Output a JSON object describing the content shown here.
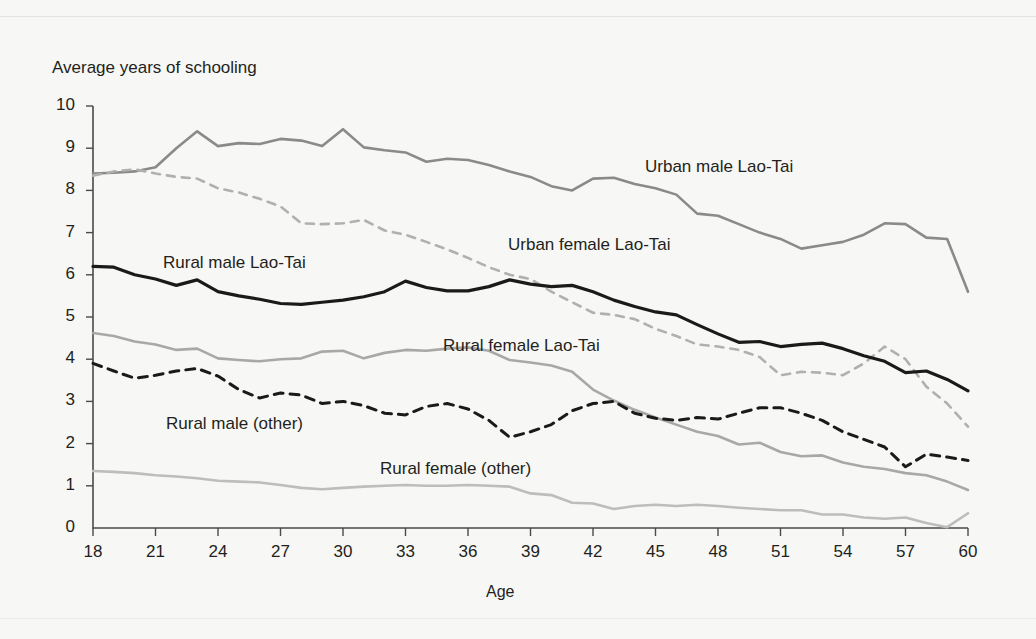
{
  "figure": {
    "y_axis_title": "Average years of schooling",
    "x_axis_title": "Age",
    "top_cropped_caption": "",
    "background_color": "#f7f7f5",
    "text_color": "#231f20"
  },
  "chart_data": {
    "type": "line",
    "title": "Average years of schooling",
    "xlabel": "Age",
    "ylabel": "Average years of schooling",
    "xlim": [
      18,
      60
    ],
    "ylim": [
      0,
      10
    ],
    "grid": false,
    "legend_position": "inline-labels",
    "x_ticks": [
      18,
      21,
      24,
      27,
      30,
      33,
      36,
      39,
      42,
      45,
      48,
      51,
      54,
      57,
      60
    ],
    "y_ticks": [
      0,
      1,
      2,
      3,
      4,
      5,
      6,
      7,
      8,
      9,
      10
    ],
    "x": [
      18,
      19,
      20,
      21,
      22,
      23,
      24,
      25,
      26,
      27,
      28,
      29,
      30,
      31,
      32,
      33,
      34,
      35,
      36,
      37,
      38,
      39,
      40,
      41,
      42,
      43,
      44,
      45,
      46,
      47,
      48,
      49,
      50,
      51,
      52,
      53,
      54,
      55,
      56,
      57,
      58,
      59,
      60
    ],
    "series": [
      {
        "name": "Urban male Lao-Tai",
        "color": "#8a8a8a",
        "style": "solid",
        "width": 2.6,
        "label_position": {
          "x": 645,
          "y": 157
        },
        "values": [
          8.4,
          8.42,
          8.45,
          8.55,
          9.0,
          9.4,
          9.05,
          9.12,
          9.1,
          9.22,
          9.18,
          9.05,
          9.45,
          9.02,
          8.95,
          8.9,
          8.68,
          8.75,
          8.72,
          8.6,
          8.45,
          8.32,
          8.1,
          8.0,
          8.28,
          8.3,
          8.15,
          8.05,
          7.9,
          7.45,
          7.4,
          7.2,
          7.0,
          6.85,
          6.62,
          6.7,
          6.78,
          6.95,
          7.22,
          7.2,
          6.88,
          6.85,
          5.6
        ]
      },
      {
        "name": "Urban female Lao-Tai",
        "color": "#b0b0b0",
        "style": "dashed",
        "width": 2.6,
        "label_position": {
          "x": 508,
          "y": 235
        },
        "values": [
          8.35,
          8.45,
          8.5,
          8.4,
          8.32,
          8.28,
          8.05,
          7.95,
          7.8,
          7.62,
          7.22,
          7.2,
          7.22,
          7.3,
          7.05,
          6.95,
          6.78,
          6.6,
          6.4,
          6.18,
          6.0,
          5.9,
          5.6,
          5.35,
          5.1,
          5.05,
          4.95,
          4.72,
          4.55,
          4.35,
          4.3,
          4.22,
          4.05,
          3.62,
          3.7,
          3.68,
          3.62,
          3.9,
          4.3,
          4.0,
          3.35,
          2.95,
          2.4
        ]
      },
      {
        "name": "Rural male Lao-Tai",
        "color": "#1a1a1a",
        "style": "solid",
        "width": 3.2,
        "label_position": {
          "x": 163,
          "y": 253
        },
        "values": [
          6.2,
          6.18,
          6.0,
          5.9,
          5.75,
          5.88,
          5.6,
          5.5,
          5.42,
          5.32,
          5.3,
          5.35,
          5.4,
          5.48,
          5.6,
          5.85,
          5.7,
          5.62,
          5.62,
          5.72,
          5.88,
          5.78,
          5.72,
          5.75,
          5.6,
          5.4,
          5.25,
          5.12,
          5.05,
          4.82,
          4.6,
          4.4,
          4.42,
          4.3,
          4.35,
          4.38,
          4.25,
          4.08,
          3.95,
          3.68,
          3.72,
          3.52,
          3.25
        ]
      },
      {
        "name": "Rural female Lao-Tai",
        "color": "#a8a8a8",
        "style": "solid",
        "width": 2.6,
        "label_position": {
          "x": 443,
          "y": 336
        },
        "values": [
          4.62,
          4.55,
          4.42,
          4.35,
          4.22,
          4.25,
          4.02,
          3.98,
          3.95,
          4.0,
          4.02,
          4.18,
          4.2,
          4.02,
          4.15,
          4.22,
          4.2,
          4.25,
          4.28,
          4.2,
          3.98,
          3.92,
          3.85,
          3.7,
          3.28,
          3.02,
          2.8,
          2.62,
          2.45,
          2.28,
          2.18,
          1.98,
          2.02,
          1.8,
          1.7,
          1.72,
          1.55,
          1.45,
          1.4,
          1.3,
          1.25,
          1.1,
          0.9
        ]
      },
      {
        "name": "Rural male (other)",
        "color": "#1a1a1a",
        "style": "dashed",
        "width": 3.0,
        "label_position": {
          "x": 166,
          "y": 414
        },
        "values": [
          3.9,
          3.72,
          3.55,
          3.62,
          3.72,
          3.78,
          3.6,
          3.28,
          3.08,
          3.2,
          3.15,
          2.95,
          3.0,
          2.9,
          2.72,
          2.68,
          2.88,
          2.95,
          2.82,
          2.55,
          2.15,
          2.28,
          2.45,
          2.78,
          2.95,
          3.0,
          2.72,
          2.6,
          2.55,
          2.62,
          2.58,
          2.72,
          2.85,
          2.85,
          2.72,
          2.55,
          2.28,
          2.1,
          1.92,
          1.45,
          1.75,
          1.68,
          1.6
        ]
      },
      {
        "name": "Rural female (other)",
        "color": "#bdbdbd",
        "style": "solid",
        "width": 2.6,
        "label_position": {
          "x": 380,
          "y": 459
        },
        "values": [
          1.35,
          1.33,
          1.3,
          1.25,
          1.22,
          1.18,
          1.12,
          1.1,
          1.08,
          1.02,
          0.95,
          0.92,
          0.95,
          0.98,
          1.0,
          1.02,
          1.0,
          1.0,
          1.02,
          1.0,
          0.98,
          0.82,
          0.78,
          0.6,
          0.58,
          0.45,
          0.52,
          0.55,
          0.52,
          0.55,
          0.52,
          0.48,
          0.45,
          0.42,
          0.42,
          0.32,
          0.32,
          0.25,
          0.22,
          0.25,
          0.12,
          0.02,
          0.35
        ]
      }
    ]
  },
  "geometry": {
    "x0": 93,
    "x1": 968,
    "y0": 528,
    "y1": 106
  }
}
